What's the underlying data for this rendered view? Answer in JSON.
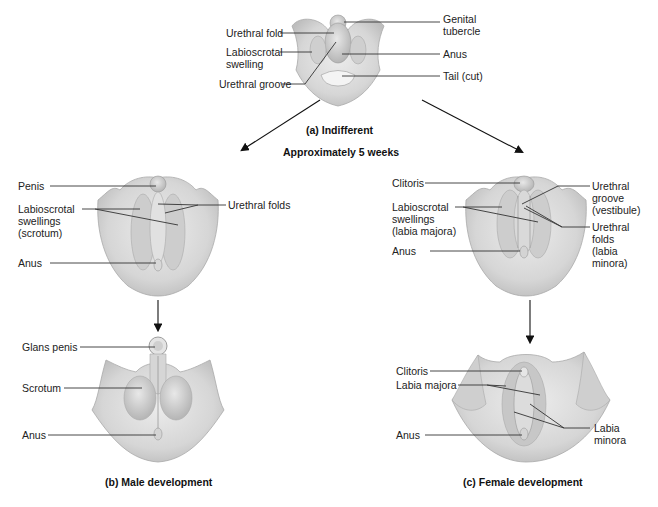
{
  "figure": {
    "panels": [
      {
        "id": "a",
        "caption": "(a) Indifferent",
        "subcaption": "Approximately 5 weeks",
        "labels": {
          "urethral_fold": "Urethral fold",
          "labioscrotal_swelling_1": "Labioscrotal",
          "labioscrotal_swelling_2": "swelling",
          "urethral_groove": "Urethral groove",
          "genital_tubercle_1": "Genital",
          "genital_tubercle_2": "tubercle",
          "anus": "Anus",
          "tail": "Tail (cut)"
        }
      },
      {
        "id": "b",
        "caption": "(b) Male development",
        "stage1_labels": {
          "penis": "Penis",
          "labioscrotal_1": "Labioscrotal",
          "labioscrotal_2": "swellings",
          "labioscrotal_3": "(scrotum)",
          "urethral_folds": "Urethral folds",
          "anus": "Anus"
        },
        "stage2_labels": {
          "glans_penis": "Glans penis",
          "scrotum": "Scrotum",
          "anus": "Anus"
        }
      },
      {
        "id": "c",
        "caption": "(c) Female development",
        "stage1_labels": {
          "clitoris": "Clitoris",
          "labioscrotal_1": "Labioscrotal",
          "labioscrotal_2": "swellings",
          "labioscrotal_3": "(labia majora)",
          "anus": "Anus",
          "urethral_groove_1": "Urethral",
          "urethral_groove_2": "groove",
          "urethral_groove_3": "(vestibule)",
          "urethral_folds_1": "Urethral",
          "urethral_folds_2": "folds",
          "urethral_folds_3": "(labia",
          "urethral_folds_4": "minora)"
        },
        "stage2_labels": {
          "clitoris": "Clitoris",
          "labia_majora": "Labia majora",
          "anus": "Anus",
          "labia_minora_1": "Labia",
          "labia_minora_2": "minora"
        }
      }
    ],
    "colors": {
      "tissue": "#dcdcdc",
      "tissue_shadow": "#b9b9b9",
      "line": "#333333",
      "background": "#ffffff"
    }
  }
}
